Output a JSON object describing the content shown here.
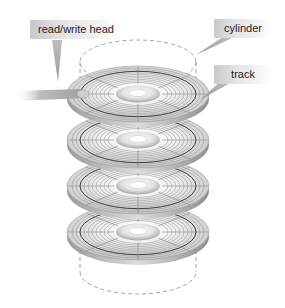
{
  "diagram": {
    "labels": {
      "read_write_head": "read/write head",
      "cylinder": "cylinder",
      "track": "track"
    },
    "platter_count": 4,
    "colors": {
      "background": "#ffffff",
      "platter_light": "#f4f4f4",
      "platter_dark": "#b9b9b9",
      "track_line": "#7a7a7a",
      "cylinder_dash": "#8a8a8a",
      "label_text": "#222222"
    }
  }
}
